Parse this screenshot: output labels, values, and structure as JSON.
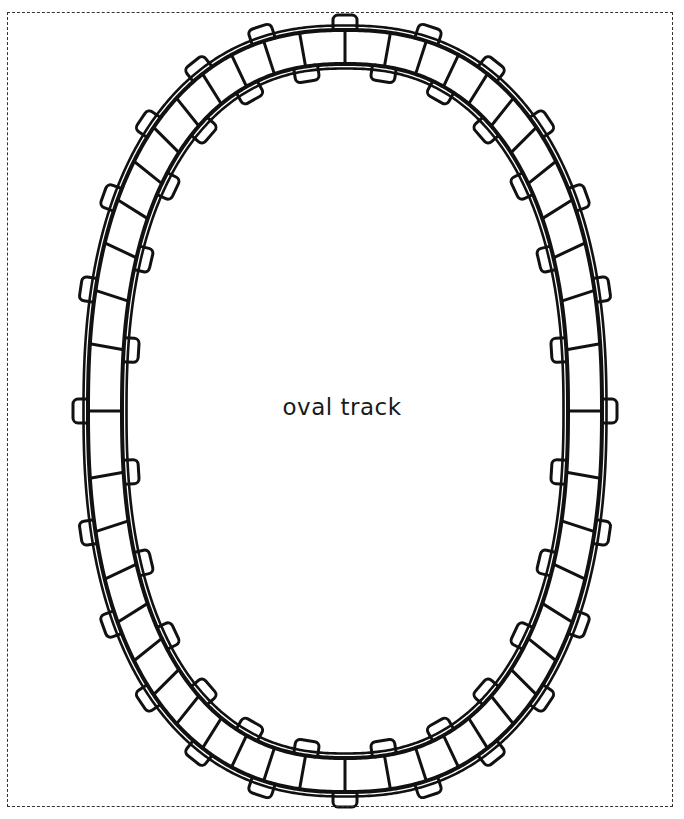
{
  "page": {
    "width": 684,
    "height": 819,
    "background_color": "#ffffff",
    "ink_color": "#111111",
    "title": "oval track"
  },
  "border": {
    "style": "dashed",
    "color": "#333333",
    "x": 7,
    "y": 12,
    "width": 666,
    "height": 795
  },
  "label": {
    "text": "oval track",
    "x": 346,
    "y": 417,
    "font_size": 23,
    "color": "#1a1a1a"
  },
  "track": {
    "shape": "oval",
    "center_x": 345,
    "center_y": 411,
    "outer_rail_rx": 257,
    "outer_rail_ry": 381,
    "rail_gap": 34,
    "rail_line_width": 4.0,
    "rail_inner_line_width": 2.6,
    "rail_double_offset": 4.5,
    "superellipse_exponent": 2.35,
    "sleeper_count": 48,
    "sleeper_line_width": 3.0,
    "tab_count_outer": 24,
    "tab_count_inner": 24,
    "tab_width": 24,
    "tab_height": 14,
    "tab_corner_radius": 5,
    "tab_line_width": 3.0,
    "tab_outer_phase_offset": 0.0,
    "tab_inner_phase_offset": 0.5,
    "stroke_color": "#111111",
    "fill_color": "#ffffff"
  },
  "chart_data": {
    "type": "diagram",
    "title": "oval track",
    "elements": [
      {
        "name": "outer-rail",
        "kind": "closed-curve",
        "rx": 257,
        "ry": 381
      },
      {
        "name": "inner-rail",
        "kind": "closed-curve",
        "rx": 223,
        "ry": 347
      },
      {
        "name": "sleepers",
        "kind": "radial-bars",
        "count": 48
      },
      {
        "name": "outer-tabs",
        "kind": "rounded-rect",
        "count": 24
      },
      {
        "name": "inner-tabs",
        "kind": "rounded-rect",
        "count": 24
      },
      {
        "name": "page-border",
        "kind": "dashed-rect"
      },
      {
        "name": "caption",
        "kind": "text",
        "value": "oval track"
      }
    ]
  }
}
